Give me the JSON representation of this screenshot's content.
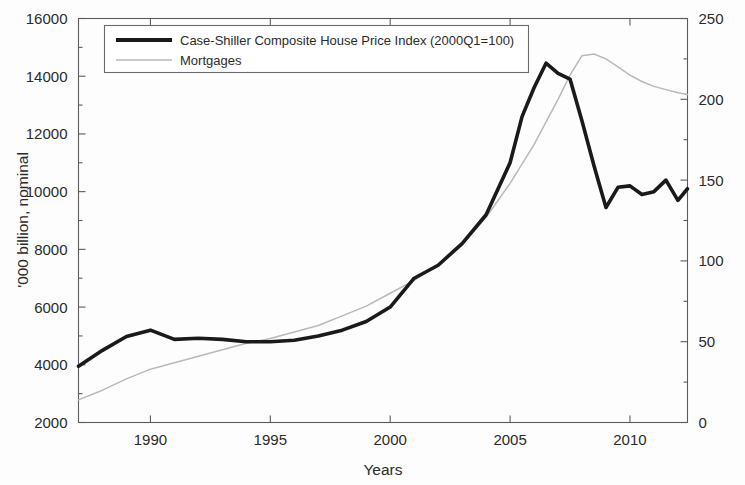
{
  "chart_data": {
    "type": "line",
    "title": "",
    "xlabel": "Years",
    "ylabel": "'000 billion, nominal",
    "ylabel_right": "",
    "xlim": [
      1987,
      2012.4
    ],
    "ylim": [
      2000,
      16000
    ],
    "ylim_right": [
      0,
      250
    ],
    "xticks": [
      1990,
      1995,
      2000,
      2005,
      2010
    ],
    "xtick_labels": [
      "1990",
      "1995",
      "2000",
      "2005",
      "2010"
    ],
    "yticks": [
      2000,
      4000,
      6000,
      8000,
      10000,
      12000,
      14000,
      16000
    ],
    "ytick_labels": [
      "2000",
      "4000",
      "6000",
      "8000",
      "10000",
      "12000",
      "14000",
      "16000"
    ],
    "yticks_right": [
      0,
      50,
      100,
      150,
      200,
      250
    ],
    "ytick_labels_right": [
      "0",
      "50",
      "100",
      "150",
      "200",
      "250"
    ],
    "grid": false,
    "legend_position": "top-center",
    "series": [
      {
        "name": "Case-Shiller Composite House Price Index (2000Q1=100)",
        "axis": "left",
        "color": "#1a1a1a",
        "style": "thick-solid",
        "x": [
          1987.0,
          1988.0,
          1989.0,
          1990.0,
          1991.0,
          1992.0,
          1993.0,
          1994.0,
          1995.0,
          1996.0,
          1997.0,
          1998.0,
          1999.0,
          2000.0,
          2001.0,
          2002.0,
          2003.0,
          2004.0,
          2005.0,
          2005.5,
          2006.0,
          2006.5,
          2007.0,
          2007.5,
          2008.0,
          2008.5,
          2009.0,
          2009.5,
          2010.0,
          2010.5,
          2011.0,
          2011.5,
          2012.0,
          2012.4
        ],
        "values": [
          3950,
          4500,
          4980,
          5200,
          4880,
          4920,
          4880,
          4800,
          4800,
          4850,
          5000,
          5200,
          5500,
          6000,
          7000,
          7450,
          8200,
          9200,
          11000,
          12600,
          13600,
          14450,
          14100,
          13900,
          12450,
          10900,
          9450,
          10150,
          10200,
          9900,
          10000,
          10400,
          9700,
          10100
        ]
      },
      {
        "name": "Mortgages",
        "axis": "right",
        "color": "#b9b9b9",
        "style": "thin-solid",
        "x": [
          1987.0,
          1988.0,
          1989.0,
          1990.0,
          1991.0,
          1992.0,
          1993.0,
          1994.0,
          1995.0,
          1996.0,
          1997.0,
          1998.0,
          1999.0,
          2000.0,
          2001.0,
          2002.0,
          2003.0,
          2004.0,
          2005.0,
          2006.0,
          2006.5,
          2007.0,
          2007.5,
          2008.0,
          2008.5,
          2009.0,
          2009.5,
          2010.0,
          2010.5,
          2011.0,
          2011.5,
          2012.0,
          2012.4
        ],
        "values": [
          14,
          20,
          27,
          33,
          37,
          41,
          45,
          49,
          52,
          56,
          60,
          66,
          72,
          80,
          88,
          98,
          110,
          127,
          148,
          172,
          186,
          200,
          215,
          227,
          228,
          225,
          220,
          215,
          211,
          208,
          206,
          204,
          203
        ]
      }
    ],
    "legend_entries": [
      {
        "label": "Case-Shiller Composite House Price Index (2000Q1=100)",
        "style": "thick-solid",
        "color": "#1a1a1a"
      },
      {
        "label": "Mortgages",
        "style": "thin-solid",
        "color": "#b9b9b9"
      }
    ]
  },
  "colors": {
    "primary_series": "#1a1a1a",
    "secondary_series": "#b9b9b9",
    "axis": "#5c5c5c",
    "text": "#2b2b2b",
    "background": "#fdfdfd"
  }
}
